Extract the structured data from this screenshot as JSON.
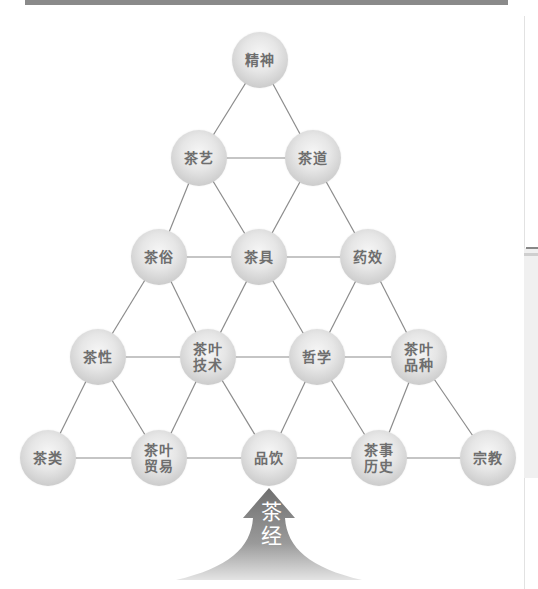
{
  "diagram": {
    "title": "",
    "nodes": [
      {
        "id": "jingshen",
        "label": "精神",
        "x": 260,
        "y": 60
      },
      {
        "id": "chayi",
        "label": "茶艺",
        "x": 199,
        "y": 158
      },
      {
        "id": "chadao",
        "label": "茶道",
        "x": 313,
        "y": 158
      },
      {
        "id": "chasu",
        "label": "茶俗",
        "x": 159,
        "y": 257
      },
      {
        "id": "chaju",
        "label": "茶具",
        "x": 259,
        "y": 257
      },
      {
        "id": "yaoxiao",
        "label": "药效",
        "x": 368,
        "y": 257
      },
      {
        "id": "chaxing",
        "label": "茶性",
        "x": 98,
        "y": 357
      },
      {
        "id": "chaye_jishu",
        "label": "茶叶\n技术",
        "x": 208,
        "y": 357
      },
      {
        "id": "zhexue",
        "label": "哲学",
        "x": 317,
        "y": 357
      },
      {
        "id": "chaye_pinzhong",
        "label": "茶叶\n品种",
        "x": 419,
        "y": 357
      },
      {
        "id": "chalei",
        "label": "茶类",
        "x": 48,
        "y": 458
      },
      {
        "id": "chaye_maoyi",
        "label": "茶叶\n贸易",
        "x": 159,
        "y": 458
      },
      {
        "id": "pinyin",
        "label": "品饮",
        "x": 269,
        "y": 458
      },
      {
        "id": "chashi_lishi",
        "label": "茶事\n历史",
        "x": 379,
        "y": 458
      },
      {
        "id": "zongjiao",
        "label": "宗教",
        "x": 488,
        "y": 458
      }
    ],
    "edges": [
      [
        "jingshen",
        "chayi"
      ],
      [
        "jingshen",
        "chadao"
      ],
      [
        "chayi",
        "chadao"
      ],
      [
        "chayi",
        "chasu"
      ],
      [
        "chayi",
        "chaju"
      ],
      [
        "chadao",
        "chaju"
      ],
      [
        "chadao",
        "yaoxiao"
      ],
      [
        "chasu",
        "chaju"
      ],
      [
        "chaju",
        "yaoxiao"
      ],
      [
        "chasu",
        "chaxing"
      ],
      [
        "chasu",
        "chaye_jishu"
      ],
      [
        "chaju",
        "chaye_jishu"
      ],
      [
        "chaju",
        "zhexue"
      ],
      [
        "yaoxiao",
        "zhexue"
      ],
      [
        "yaoxiao",
        "chaye_pinzhong"
      ],
      [
        "chaxing",
        "chaye_jishu"
      ],
      [
        "chaye_jishu",
        "zhexue"
      ],
      [
        "zhexue",
        "chaye_pinzhong"
      ],
      [
        "chaxing",
        "chalei"
      ],
      [
        "chaxing",
        "chaye_maoyi"
      ],
      [
        "chaye_jishu",
        "chaye_maoyi"
      ],
      [
        "chaye_jishu",
        "pinyin"
      ],
      [
        "zhexue",
        "pinyin"
      ],
      [
        "zhexue",
        "chashi_lishi"
      ],
      [
        "chaye_pinzhong",
        "chashi_lishi"
      ],
      [
        "chaye_pinzhong",
        "zongjiao"
      ],
      [
        "chalei",
        "chaye_maoyi"
      ],
      [
        "chaye_maoyi",
        "pinyin"
      ],
      [
        "pinyin",
        "chashi_lishi"
      ],
      [
        "chashi_lishi",
        "zongjiao"
      ]
    ],
    "base_arrow": {
      "label": "茶\n经"
    }
  },
  "colors": {
    "edge": "#8c8c8c",
    "node_text": "#6e6e6e",
    "arrow_top": "#7a7a7a",
    "arrow_bottom": "#d8d8d8",
    "top_bar": "#8a8a8a"
  }
}
